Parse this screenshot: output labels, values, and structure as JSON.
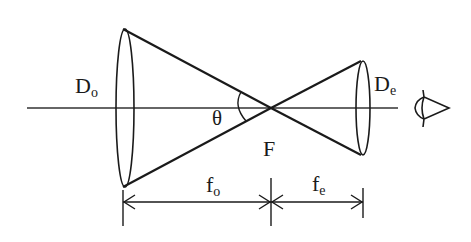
{
  "diagram": {
    "type": "Keplerian telescope ray diagram",
    "labels": {
      "objective_diameter": {
        "main": "D",
        "sub": "o"
      },
      "eyepiece_diameter": {
        "main": "D",
        "sub": "e"
      },
      "angle": "θ",
      "focal_point": "F",
      "objective_focal_length": {
        "main": "f",
        "sub": "o"
      },
      "eyepiece_focal_length": {
        "main": "f",
        "sub": "e"
      }
    },
    "icons": {
      "eye": "eye-icon"
    },
    "colors": {
      "line": "#1a1a1a",
      "background": "#ffffff"
    }
  }
}
